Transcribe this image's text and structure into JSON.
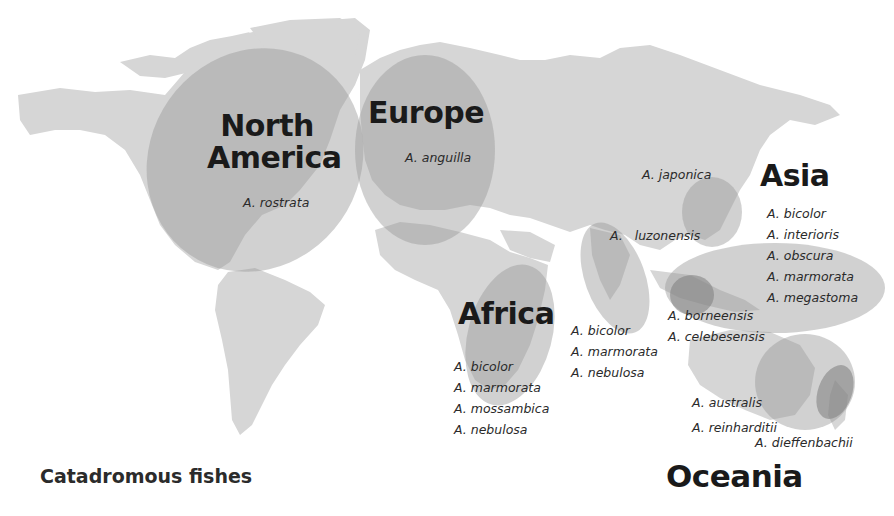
{
  "figure": {
    "caption": "Catadromous fishes",
    "colors": {
      "background": "#ffffff",
      "land": "#d6d6d6",
      "region_overlay": "#9a9a9a",
      "region_core": "#7d7d7d",
      "text": "#1a1a1a"
    }
  },
  "regions": {
    "north_america": {
      "label_line1": "North",
      "label_line2": "America",
      "species": [
        "A. rostrata"
      ]
    },
    "europe": {
      "label": "Europe",
      "species": [
        "A. anguilla"
      ]
    },
    "asia": {
      "label": "Asia",
      "species_north": [
        "A. japonica"
      ],
      "species_luzon": "A.   luzonensis",
      "species": [
        "A. bicolor",
        "A. interioris",
        "A. obscura",
        "A. marmorata",
        "A. megastoma"
      ]
    },
    "africa": {
      "label": "Africa",
      "species": [
        "A. bicolor",
        "A. marmorata",
        "A. mossambica",
        "A. nebulosa"
      ]
    },
    "indian_ocean": {
      "species": [
        "A. bicolor",
        "A. marmorata",
        "A. nebulosa"
      ]
    },
    "indonesia": {
      "species": [
        "A. borneensis",
        "A. celebesensis"
      ]
    },
    "oceania": {
      "label": "Oceania",
      "species": [
        "A. australis",
        "A. reinharditii"
      ],
      "species_nz": "A. dieffenbachii"
    }
  }
}
